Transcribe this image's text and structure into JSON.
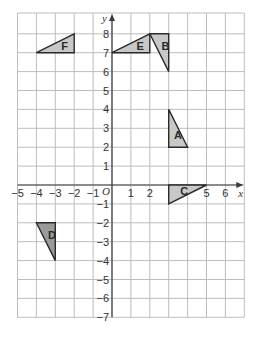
{
  "diagram": {
    "title": "",
    "axes": {
      "x_label": "x",
      "y_label": "y",
      "origin_label": "O",
      "x_range": [
        -5,
        7
      ],
      "y_range": [
        -7,
        8.5
      ],
      "x_ticks": [
        "-5",
        "-4",
        "-3",
        "-2",
        "-1",
        "1",
        "2",
        "5",
        "6"
      ],
      "y_ticks": [
        "8",
        "7",
        "6",
        "5",
        "4",
        "3",
        "2",
        "1",
        "-1",
        "-2",
        "-3",
        "-4",
        "-5",
        "-6",
        "-7"
      ]
    },
    "shapes": [
      {
        "label": "F",
        "vertices": [
          [
            -4,
            7
          ],
          [
            -2,
            8
          ],
          [
            -2,
            7
          ]
        ],
        "fill": "#c8c8c8"
      },
      {
        "label": "E",
        "vertices": [
          [
            0,
            7
          ],
          [
            2,
            8
          ],
          [
            2,
            7
          ]
        ],
        "fill": "#c8c8c8"
      },
      {
        "label": "B",
        "vertices": [
          [
            2,
            8
          ],
          [
            3,
            8
          ],
          [
            3,
            6
          ]
        ],
        "fill": "#c8c8c8"
      },
      {
        "label": "A",
        "vertices": [
          [
            3,
            4
          ],
          [
            3,
            2
          ],
          [
            4,
            2
          ]
        ],
        "fill": "#c8c8c8"
      },
      {
        "label": "C",
        "vertices": [
          [
            3,
            0
          ],
          [
            5,
            0
          ],
          [
            3,
            -1
          ]
        ],
        "fill": "#c8c8c8"
      },
      {
        "label": "D",
        "vertices": [
          [
            -4,
            -2
          ],
          [
            -3,
            -2
          ],
          [
            -3,
            -4
          ]
        ],
        "fill": "#9a9a9a"
      }
    ],
    "colors": {
      "grid": "#bdbdbd",
      "axis": "#3a3a3a",
      "shape_fill_light": "#c8c8c8",
      "shape_fill_dark": "#9a9a9a"
    }
  }
}
